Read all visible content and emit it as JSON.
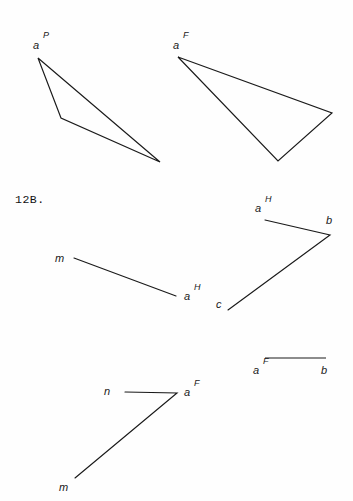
{
  "page": {
    "background_color": "#fefefe",
    "stroke_color": "#1a1a1a",
    "width": 353,
    "height": 501
  },
  "exercise": {
    "number_label": "12B."
  },
  "figures": {
    "top_left_triangle": {
      "name": "projection-triangle-a-P",
      "vertex_label": "a",
      "vertex_superscript": "P",
      "points": "38,58 61,118 160,162"
    },
    "top_right_triangle": {
      "name": "projection-triangle-a-F",
      "vertex_label": "a",
      "vertex_superscript": "F",
      "points": "178,57 278,161 332,113"
    },
    "mid_left_segment": {
      "name": "segment-m-to-a-H",
      "start_label": "m",
      "end_label": "a",
      "end_superscript": "H",
      "points": "74,258 176,296"
    },
    "mid_right_polyline": {
      "name": "polyline-a-H-b-c",
      "a_label": "a",
      "a_superscript": "H",
      "b_label": "b",
      "c_label": "c",
      "points": "265,220 330,235 228,310"
    },
    "bottom_left_polyline": {
      "name": "polyline-n-a-F-m",
      "n_label": "n",
      "a_label": "a",
      "a_superscript": "F",
      "m_label": "m",
      "points": "125,392 177,393 75,478"
    },
    "bottom_right_segment": {
      "name": "segment-a-F-to-b",
      "a_label": "a",
      "a_superscript": "F",
      "b_label": "b",
      "points": "265,358 326,358"
    }
  }
}
